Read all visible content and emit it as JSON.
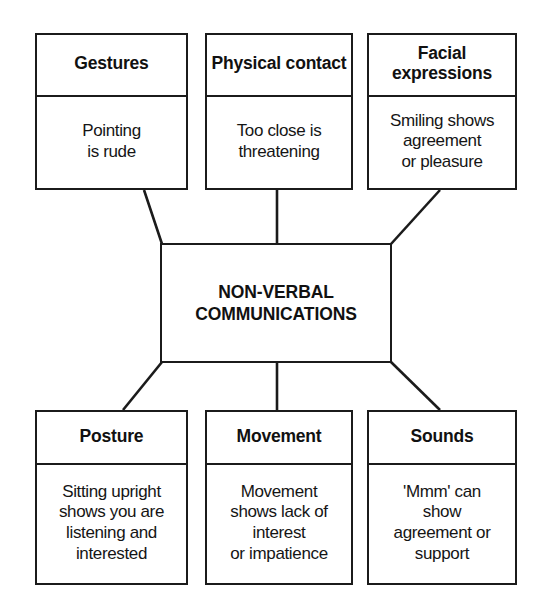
{
  "diagram": {
    "title": "NON-VERBAL COMMUNICATIONS",
    "center": {
      "label": "NON-VERBAL\nCOMMUNICATIONS"
    },
    "top_nodes": [
      {
        "header": "Gestures",
        "body": "Pointing\nis rude"
      },
      {
        "header": "Physical\ncontact",
        "body": "Too close is\nthreatening"
      },
      {
        "header": "Facial\nexpressions",
        "body": "Smiling shows\nagreement\nor pleasure"
      }
    ],
    "bottom_nodes": [
      {
        "header": "Posture",
        "body": "Sitting upright\nshows you are\nlistening and\ninterested"
      },
      {
        "header": "Movement",
        "body": "Movement\nshows lack of\ninterest\nor impatience"
      },
      {
        "header": "Sounds",
        "body": "'Mmm' can\nshow\nagreement or\nsupport"
      }
    ],
    "colors": {
      "stroke": "#1b1b1b",
      "background": "#ffffff",
      "text": "#111111"
    }
  }
}
